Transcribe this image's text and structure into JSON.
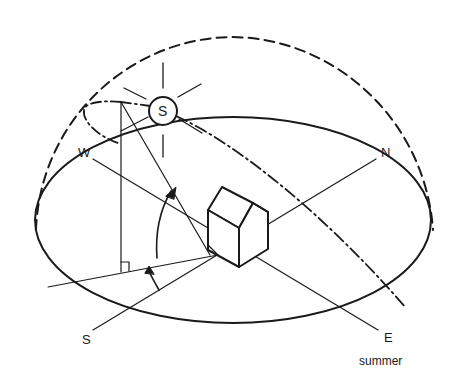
{
  "diagram": {
    "labels": {
      "west": "W",
      "north": "N",
      "south": "S",
      "east": "E",
      "sun": "S",
      "season": "summer"
    },
    "elements": [
      "celestial-dome-dashed",
      "horizon-ellipse",
      "sun-path-dash-dot",
      "sun-symbol",
      "house",
      "altitude-angle-arc",
      "azimuth-angle-arc",
      "right-angle-mark",
      "compass-axes"
    ],
    "colors": {
      "stroke": "#1a1a1a",
      "background": "#ffffff"
    }
  }
}
